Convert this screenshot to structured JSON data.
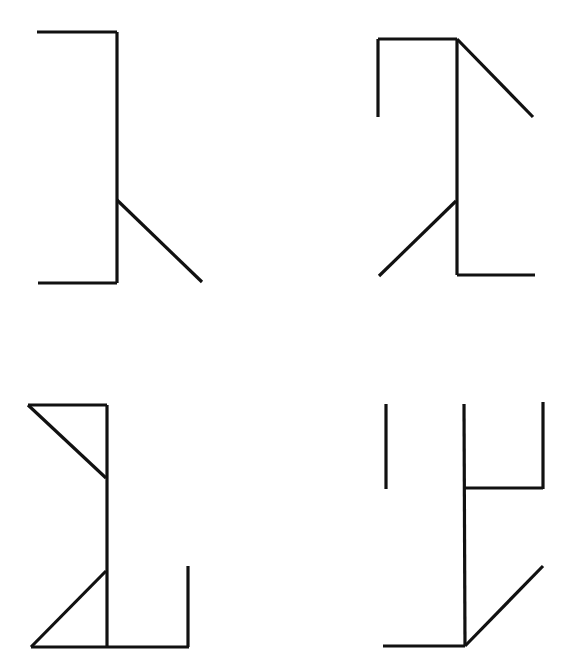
{
  "diagram": {
    "stroke_color": "#111111",
    "background": "#ffffff",
    "figures": [
      {
        "id": "figure-top-left",
        "segments": [
          [
            37,
            32,
            117,
            32
          ],
          [
            117,
            32,
            117,
            283
          ],
          [
            38,
            283,
            117,
            283
          ],
          [
            117,
            200,
            202,
            282
          ]
        ]
      },
      {
        "id": "figure-top-right",
        "segments": [
          [
            378,
            39,
            457,
            39
          ],
          [
            378,
            39,
            378,
            117
          ],
          [
            457,
            39,
            457,
            275
          ],
          [
            457,
            39,
            533,
            117
          ],
          [
            456,
            201,
            379,
            276
          ],
          [
            457,
            275,
            535,
            275
          ]
        ]
      },
      {
        "id": "figure-bottom-left",
        "segments": [
          [
            28,
            405,
            107,
            405
          ],
          [
            107,
            405,
            107,
            647
          ],
          [
            28,
            405,
            106,
            478
          ],
          [
            106,
            571,
            31,
            647
          ],
          [
            31,
            647,
            189,
            647
          ],
          [
            188,
            566,
            188,
            647
          ]
        ]
      },
      {
        "id": "figure-bottom-right",
        "segments": [
          [
            386,
            404,
            386,
            489
          ],
          [
            464,
            404,
            465,
            646
          ],
          [
            543,
            402,
            543,
            489
          ],
          [
            465,
            488,
            543,
            488
          ],
          [
            383,
            646,
            465,
            646
          ],
          [
            465,
            646,
            543,
            566
          ]
        ]
      }
    ]
  }
}
